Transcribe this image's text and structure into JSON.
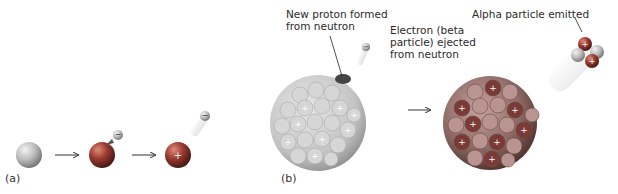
{
  "panels": {
    "a": {
      "label": "(a)"
    },
    "b": {
      "label": "(b)"
    }
  },
  "annotations": {
    "new_proton": [
      "New proton formed",
      "from neutron"
    ],
    "electron": [
      "Electron (beta",
      "particle) ejected",
      "from neutron"
    ],
    "alpha": "Alpha particle emitted"
  },
  "colors": {
    "neutron": "#b8b8b8",
    "proton": "#c0392b",
    "nucleus_light": "#cfcfcf",
    "nucleus_dark": "#8a3a3a",
    "arrow": "#333333"
  },
  "symbols": {
    "proton_sign": "+",
    "electron_sign": "−"
  }
}
